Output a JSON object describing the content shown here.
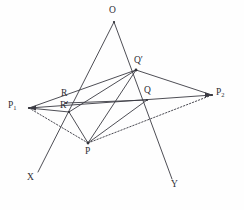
{
  "figure": {
    "background_color": "#fefefe",
    "line_color": "#3a3a42",
    "label_color": "#2e2e35",
    "width": 244,
    "height": 210
  },
  "labels": {
    "O": "O",
    "Q_prime": "Q′",
    "Q": "Q",
    "R": "R",
    "R_prime": "R′",
    "P": "P",
    "P1": "P",
    "P1_sub": "1",
    "P2": "P",
    "P2_sub": "2",
    "X": "X",
    "Y": "Y"
  },
  "points": {
    "O": {
      "x": 114,
      "y": 22,
      "label": "O",
      "label_x": 109,
      "label_y": 6
    },
    "Qprime": {
      "x": 136,
      "y": 70,
      "label": "Q′",
      "label_x": 134,
      "label_y": 56
    },
    "Q": {
      "x": 147,
      "y": 100,
      "label": "Q",
      "label_x": 144,
      "label_y": 86
    },
    "R": {
      "x": 66,
      "y": 103,
      "label": "R",
      "label_x": 61,
      "label_y": 89
    },
    "Rprime": {
      "x": 69,
      "y": 112,
      "label": "R′",
      "label_x": 60,
      "label_y": 101
    },
    "P": {
      "x": 88,
      "y": 143,
      "label": "P",
      "label_x": 85,
      "label_y": 147
    },
    "P1": {
      "x": 29,
      "y": 108,
      "label": "P1",
      "label_x": 8,
      "label_y": 101
    },
    "P2": {
      "x": 212,
      "y": 95,
      "label": "P2",
      "label_x": 216,
      "label_y": 88
    },
    "X": {
      "x": 38,
      "y": 172,
      "label": "X",
      "label_x": 27,
      "label_y": 173
    },
    "Y": {
      "x": 172,
      "y": 179,
      "label": "Y",
      "label_x": 171,
      "label_y": 180
    }
  },
  "solid_segments": [
    {
      "name": "O-to-X-ray",
      "from": "O",
      "to": "X"
    },
    {
      "name": "O-to-Y-ray",
      "from": "O",
      "to": "Y"
    },
    {
      "name": "P1-to-P2-line",
      "from": "P1",
      "to": "P2"
    },
    {
      "name": "P1-to-Rprime",
      "from": "P1",
      "to": "Rprime"
    },
    {
      "name": "Rprime-to-P",
      "from": "Rprime",
      "to": "P"
    },
    {
      "name": "Qprime-to-P2",
      "from": "Qprime",
      "to": "P2"
    },
    {
      "name": "Qprime-to-P",
      "from": "Qprime",
      "to": "P"
    },
    {
      "name": "Qprime-to-Rprime",
      "from": "Qprime",
      "to": "Rprime"
    },
    {
      "name": "Q-to-P",
      "from": "Q",
      "to": "P"
    },
    {
      "name": "R-to-Q",
      "from": "R",
      "to": "Q"
    },
    {
      "name": "P1-to-Qprime",
      "from": "P1",
      "to": "Qprime"
    }
  ],
  "dotted_segments": [
    {
      "name": "P1-to-P-dotted",
      "from": "P1",
      "to": "P"
    },
    {
      "name": "P-to-P2-dotted",
      "from": "P",
      "to": "P2"
    }
  ],
  "arrowheads": [
    {
      "name": "arrowhead-at-P1",
      "at": "P1"
    },
    {
      "name": "arrowhead-at-P2",
      "at": "P2"
    }
  ]
}
